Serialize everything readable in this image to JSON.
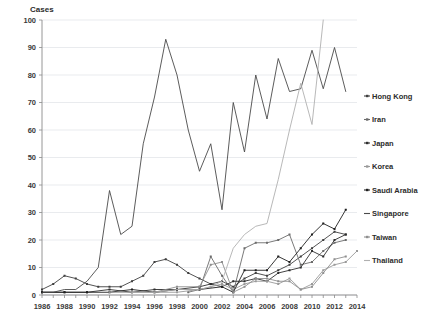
{
  "chart_data": {
    "type": "line",
    "title": "",
    "ylabel": "Cases",
    "xlabel": "",
    "ylim": [
      0,
      100
    ],
    "ytick_step": 10,
    "yticks": [
      0,
      10,
      20,
      30,
      40,
      50,
      60,
      70,
      80,
      90,
      100
    ],
    "xlim": [
      1986,
      2014
    ],
    "xticks_labeled": [
      1986,
      1988,
      1990,
      1992,
      1994,
      1996,
      1998,
      2000,
      2002,
      2004,
      2006,
      2008,
      2010,
      2012,
      2014
    ],
    "x": [
      1986,
      1987,
      1988,
      1989,
      1990,
      1991,
      1992,
      1993,
      1994,
      1995,
      1996,
      1997,
      1998,
      1999,
      2000,
      2001,
      2002,
      2003,
      2004,
      2005,
      2006,
      2007,
      2008,
      2009,
      2010,
      2011,
      2012,
      2013,
      2014
    ],
    "grid": true,
    "legend_position": "right",
    "series": [
      {
        "name": "Hong Kong",
        "color": "#3f3f3f",
        "marker": true,
        "x": [
          1986,
          1987,
          1988,
          1989,
          1990,
          1991,
          1992,
          1993,
          1994,
          1995,
          1996,
          1997,
          1998,
          1999,
          2000,
          2001,
          2002,
          2003,
          2004,
          2005,
          2006,
          2007,
          2008,
          2009,
          2010,
          2011,
          2012,
          2013
        ],
        "values": [
          2,
          4,
          7,
          6,
          4,
          3,
          3,
          3,
          5,
          7,
          12,
          13,
          11,
          8,
          6,
          4,
          5,
          3,
          6,
          8,
          7,
          9,
          11,
          14,
          17,
          20,
          23,
          22
        ]
      },
      {
        "name": "Iran",
        "color": "#6b6b6b",
        "marker": true,
        "x": [
          1999,
          2000,
          2001,
          2002,
          2003,
          2004,
          2005,
          2006,
          2007,
          2008,
          2009,
          2010,
          2011,
          2012,
          2013
        ],
        "values": [
          1,
          2,
          14,
          7,
          1,
          17,
          19,
          19,
          20,
          22,
          11,
          12,
          16,
          19,
          20
        ]
      },
      {
        "name": "Japan",
        "color": "#2e2e2e",
        "marker": true,
        "x": [
          1986,
          1988,
          1990,
          1992,
          1994,
          1996,
          1998,
          2000,
          2001,
          2002,
          2003,
          2004,
          2005,
          2006,
          2007,
          2008,
          2009,
          2010,
          2011,
          2012,
          2013
        ],
        "values": [
          1,
          1,
          1,
          2,
          1,
          2,
          2,
          3,
          4,
          3,
          5,
          5,
          6,
          5,
          8,
          9,
          10,
          16,
          14,
          20,
          22
        ]
      },
      {
        "name": "Korea",
        "color": "#9a9a9a",
        "marker": true,
        "x": [
          1994,
          1996,
          1998,
          2000,
          2001,
          2002,
          2003,
          2004,
          2005,
          2006,
          2007,
          2008,
          2009,
          2010,
          2011,
          2012,
          2013,
          2014
        ],
        "values": [
          1,
          1,
          1,
          2,
          3,
          4,
          2,
          4,
          5,
          5,
          4,
          6,
          2,
          4,
          9,
          11,
          12,
          16
        ]
      },
      {
        "name": "Saudi Arabia",
        "color": "#1f1f1f",
        "marker": true,
        "x": [
          1986,
          1988,
          1990,
          1992,
          1994,
          1996,
          1998,
          2000,
          2002,
          2003,
          2004,
          2005,
          2006,
          2007,
          2008,
          2009,
          2010,
          2011,
          2012,
          2013
        ],
        "values": [
          1,
          1,
          1,
          1,
          2,
          1,
          2,
          2,
          3,
          1,
          9,
          9,
          9,
          14,
          12,
          17,
          22,
          26,
          24,
          31
        ]
      },
      {
        "name": "Singapore",
        "color": "#4a4a4a",
        "marker": false,
        "x": [
          1986,
          1987,
          1988,
          1989,
          1990,
          1991,
          1992,
          1993,
          1994,
          1995,
          1996,
          1997,
          1998,
          1999,
          2000,
          2001,
          2002,
          2003,
          2004,
          2005,
          2006,
          2007,
          2008,
          2009,
          2010,
          2011,
          2012,
          2013
        ],
        "values": [
          1,
          1,
          2,
          2,
          5,
          10,
          38,
          22,
          25,
          55,
          72,
          93,
          80,
          60,
          45,
          55,
          31,
          70,
          52,
          80,
          64,
          86,
          74,
          75,
          89,
          75,
          90,
          74
        ]
      },
      {
        "name": "Taiwan",
        "color": "#8f8f8f",
        "marker": true,
        "x": [
          1992,
          1994,
          1996,
          1998,
          2000,
          2001,
          2002,
          2003,
          2004,
          2005,
          2006,
          2007,
          2008,
          2009,
          2010,
          2011,
          2012,
          2013
        ],
        "values": [
          1,
          1,
          1,
          3,
          3,
          11,
          12,
          1,
          3,
          6,
          6,
          5,
          5,
          2,
          3,
          8,
          13,
          14
        ]
      },
      {
        "name": "Thailand",
        "color": "#b0b0b0",
        "marker": false,
        "x": [
          1994,
          1996,
          1998,
          2000,
          2001,
          2002,
          2003,
          2004,
          2005,
          2006,
          2007,
          2008,
          2009,
          2010,
          2011
        ],
        "values": [
          1,
          1,
          2,
          2,
          3,
          5,
          17,
          22,
          25,
          26,
          42,
          60,
          77,
          62,
          100
        ]
      }
    ]
  },
  "legend": {
    "items": [
      {
        "label": "Hong Kong"
      },
      {
        "label": "Iran"
      },
      {
        "label": "Japan"
      },
      {
        "label": "Korea"
      },
      {
        "label": "Saudi Arabia"
      },
      {
        "label": "Singapore"
      },
      {
        "label": "Taiwan"
      },
      {
        "label": "Thailand"
      }
    ]
  }
}
